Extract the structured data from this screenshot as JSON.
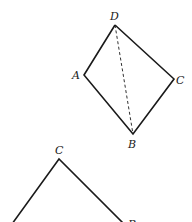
{
  "figure_top": {
    "vertices": {
      "D": {
        "label": "D",
        "x": 115,
        "y": 25
      },
      "A": {
        "label": "A",
        "x": 84,
        "y": 75
      },
      "C": {
        "label": "C",
        "x": 174,
        "y": 79
      },
      "B": {
        "label": "B",
        "x": 133,
        "y": 134
      }
    },
    "solid_edges": [
      "D-A",
      "A-B",
      "B-C",
      "C-D"
    ],
    "dashed_edges": [
      "D-B"
    ]
  },
  "figure_bottom": {
    "vertices": {
      "C": {
        "label": "C",
        "x": 59,
        "y": 159
      },
      "left": {
        "label": "",
        "x": 12,
        "y": 222
      },
      "B": {
        "label": "B",
        "x": 124,
        "y": 222
      }
    },
    "solid_edges": [
      "left-C",
      "C-B"
    ]
  },
  "colors": {
    "line": "#1a1a1a",
    "background": "#ffffff"
  }
}
